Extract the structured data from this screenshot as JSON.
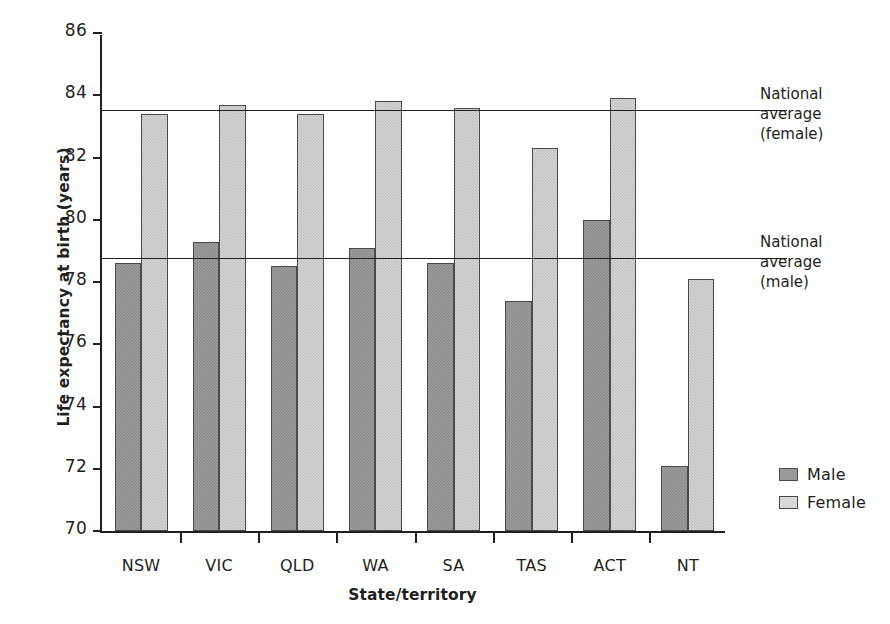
{
  "chart_data": {
    "type": "bar",
    "title": "",
    "xlabel": "State/territory",
    "ylabel": "Life expectancy at birth (years)",
    "categories": [
      "NSW",
      "VIC",
      "QLD",
      "WA",
      "SA",
      "TAS",
      "ACT",
      "NT"
    ],
    "series": [
      {
        "name": "Male",
        "color": "#8e8e8e",
        "values": [
          78.6,
          79.3,
          78.5,
          79.1,
          78.6,
          77.4,
          80.0,
          72.1
        ]
      },
      {
        "name": "Female",
        "color": "#c6c6c6",
        "values": [
          83.4,
          83.7,
          83.4,
          83.8,
          83.6,
          82.3,
          83.9,
          78.1
        ]
      }
    ],
    "ylim": [
      70,
      86
    ],
    "yticks": [
      70,
      72,
      74,
      76,
      78,
      80,
      82,
      84,
      86
    ],
    "ytick_labels": [
      "70",
      "72",
      "74",
      "76",
      "78",
      "80",
      "82",
      "84",
      "86"
    ],
    "grid": false,
    "legend_position": "right",
    "reference_lines": [
      {
        "name": "national-average-female",
        "value": 83.5,
        "label_lines": [
          "National",
          "average",
          "(female)"
        ]
      },
      {
        "name": "national-average-male",
        "value": 78.75,
        "label_lines": [
          "National",
          "average",
          "(male)"
        ]
      }
    ]
  },
  "legend": {
    "items": [
      {
        "label": "Male",
        "swatch": "male-swatch"
      },
      {
        "label": "Female",
        "swatch": "female-swatch"
      }
    ]
  }
}
